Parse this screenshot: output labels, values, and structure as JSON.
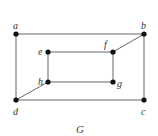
{
  "graph": {
    "caption": "G",
    "vertices": [
      {
        "id": "a",
        "label": "a",
        "x": 16,
        "y": 34
      },
      {
        "id": "b",
        "label": "b",
        "x": 144,
        "y": 34
      },
      {
        "id": "c",
        "label": "c",
        "x": 144,
        "y": 100
      },
      {
        "id": "d",
        "label": "d",
        "x": 16,
        "y": 100
      },
      {
        "id": "e",
        "label": "e",
        "x": 48,
        "y": 52
      },
      {
        "id": "f",
        "label": "f",
        "x": 113,
        "y": 52
      },
      {
        "id": "g",
        "label": "g",
        "x": 113,
        "y": 82
      },
      {
        "id": "h",
        "label": "h",
        "x": 48,
        "y": 82
      }
    ],
    "edges": [
      [
        "a",
        "b"
      ],
      [
        "b",
        "c"
      ],
      [
        "c",
        "d"
      ],
      [
        "d",
        "a"
      ],
      [
        "e",
        "f"
      ],
      [
        "f",
        "g"
      ],
      [
        "g",
        "h"
      ],
      [
        "h",
        "e"
      ],
      [
        "b",
        "f"
      ],
      [
        "d",
        "h"
      ]
    ],
    "colors": {
      "edge": "#555555",
      "vertex": "#111111",
      "label": "#333333"
    }
  }
}
